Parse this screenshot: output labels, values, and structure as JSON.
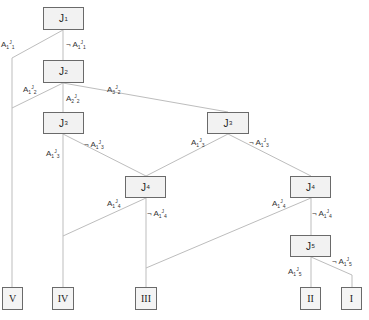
{
  "diagram": {
    "type": "decision-tree",
    "edge_color": "#bdbdbd",
    "node_fill": "#f2f2f2",
    "node_border": "#6a6a6a",
    "nodes": [
      {
        "id": "J1",
        "base": "J",
        "sub": "1",
        "x": 43,
        "y": 7,
        "w": 41,
        "h": 23
      },
      {
        "id": "J2",
        "base": "J",
        "sub": "2",
        "x": 43,
        "y": 60,
        "w": 41,
        "h": 23
      },
      {
        "id": "J3a",
        "base": "J",
        "sub": "3",
        "x": 43,
        "y": 112,
        "w": 41,
        "h": 22
      },
      {
        "id": "J3b",
        "base": "J",
        "sub": "3",
        "x": 207,
        "y": 112,
        "w": 42,
        "h": 22
      },
      {
        "id": "J4a",
        "base": "J",
        "sub": "4",
        "x": 125,
        "y": 176,
        "w": 41,
        "h": 22
      },
      {
        "id": "J4b",
        "base": "J",
        "sub": "4",
        "x": 290,
        "y": 176,
        "w": 41,
        "h": 22
      },
      {
        "id": "J5",
        "base": "J",
        "sub": "5",
        "x": 290,
        "y": 235,
        "w": 41,
        "h": 22
      }
    ],
    "leaves": [
      {
        "id": "V",
        "label": "V",
        "x": 2,
        "y": 287,
        "w": 21,
        "h": 23
      },
      {
        "id": "IV",
        "label": "IV",
        "x": 52,
        "y": 287,
        "w": 22,
        "h": 23
      },
      {
        "id": "III",
        "label": "III",
        "x": 135,
        "y": 287,
        "w": 22,
        "h": 23
      },
      {
        "id": "II",
        "label": "II",
        "x": 300,
        "y": 287,
        "w": 21,
        "h": 23
      },
      {
        "id": "I",
        "label": "I",
        "x": 341,
        "y": 287,
        "w": 21,
        "h": 23
      }
    ],
    "edge_labels": [
      {
        "id": "e1",
        "neg": "",
        "base": "A",
        "sub": "1",
        "sup": "J",
        "supsub": "1",
        "x": 1,
        "y": 41
      },
      {
        "id": "e2",
        "neg": "¬ ",
        "base": "A",
        "sub": "1",
        "sup": "J",
        "supsub": "1",
        "x": 66,
        "y": 41
      },
      {
        "id": "e3",
        "neg": "",
        "base": "A",
        "sub": "1",
        "sup": "J",
        "supsub": "2",
        "x": 23,
        "y": 86
      },
      {
        "id": "e4",
        "neg": "",
        "base": "A",
        "sub": "2",
        "sup": "J",
        "supsub": "2",
        "x": 66,
        "y": 95
      },
      {
        "id": "e5",
        "neg": "",
        "base": "A",
        "sub": "3",
        "sup": "J",
        "supsub": "2",
        "x": 107,
        "y": 86
      },
      {
        "id": "e6",
        "neg": "¬ ",
        "base": "A",
        "sub": "1",
        "sup": "J",
        "supsub": "3",
        "x": 84,
        "y": 141
      },
      {
        "id": "e7",
        "neg": "",
        "base": "A",
        "sub": "1",
        "sup": "J",
        "supsub": "3",
        "x": 46,
        "y": 150
      },
      {
        "id": "e8",
        "neg": "",
        "base": "A",
        "sub": "1",
        "sup": "J",
        "supsub": "3",
        "x": 191,
        "y": 139
      },
      {
        "id": "e9",
        "neg": "¬ ",
        "base": "A",
        "sub": "1",
        "sup": "J",
        "supsub": "3",
        "x": 249,
        "y": 139
      },
      {
        "id": "e10",
        "neg": "",
        "base": "A",
        "sub": "1",
        "sup": "J",
        "supsub": "4",
        "x": 107,
        "y": 200
      },
      {
        "id": "e11",
        "neg": "¬ ",
        "base": "A",
        "sub": "1",
        "sup": "J",
        "supsub": "4",
        "x": 147,
        "y": 210
      },
      {
        "id": "e12",
        "neg": "",
        "base": "A",
        "sub": "1",
        "sup": "J",
        "supsub": "4",
        "x": 272,
        "y": 200
      },
      {
        "id": "e13",
        "neg": "¬ ",
        "base": "A",
        "sub": "1",
        "sup": "J",
        "supsub": "4",
        "x": 312,
        "y": 210
      },
      {
        "id": "e14",
        "neg": "",
        "base": "A",
        "sub": "1",
        "sup": "J",
        "supsub": "5",
        "x": 288,
        "y": 268
      },
      {
        "id": "e15",
        "neg": "¬ ",
        "base": "A",
        "sub": "1",
        "sup": "J",
        "supsub": "5",
        "x": 332,
        "y": 258
      }
    ]
  }
}
